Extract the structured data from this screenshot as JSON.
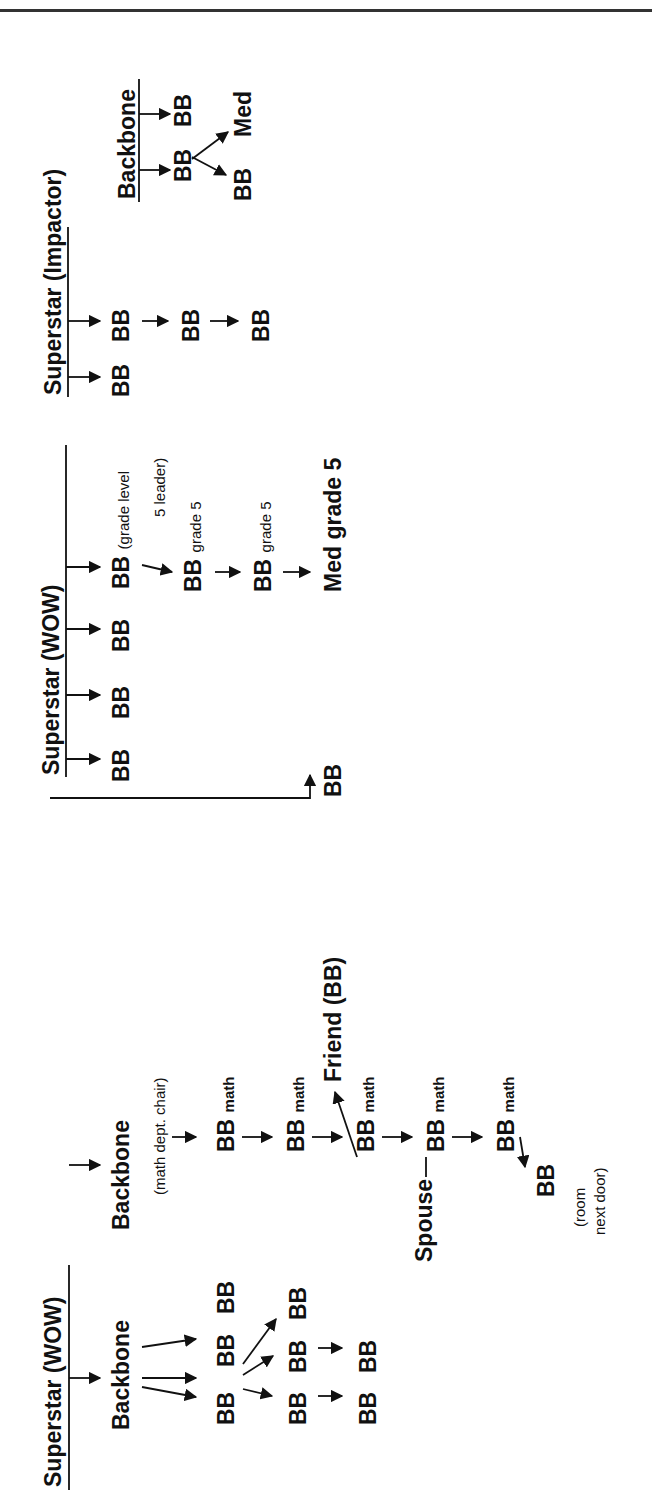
{
  "diagram": {
    "type": "mentoring-network-tree",
    "orientation": "rotated -90deg (text reads bottom-to-top)",
    "groups": [
      {
        "id": "superstar-wow-1",
        "title": "Superstar (WOW)",
        "children": [
          {
            "label": "Backbone",
            "children": [
              {
                "label": "BB",
                "children": [
                  {
                    "label": "BB",
                    "children": [
                      {
                        "label": "BB"
                      }
                    ]
                  },
                  {
                    "label": "BB",
                    "children": [
                      {
                        "label": "BB"
                      }
                    ]
                  },
                  {
                    "label": "BB"
                  }
                ]
              },
              {
                "label": "BB"
              },
              {
                "label": "BB"
              }
            ]
          },
          {
            "label": "Backbone",
            "note": "(math dept. chair)",
            "chain": [
              {
                "label": "BB",
                "suffix": "math"
              },
              {
                "label": "BB",
                "suffix": "math"
              },
              {
                "label": "BB",
                "suffix": "math",
                "branch": "Friend (BB)"
              },
              {
                "label": "BB",
                "suffix": "math",
                "linked": "Spouse"
              },
              {
                "label": "BB",
                "suffix": "math",
                "branch": "BB (room next door)"
              }
            ]
          }
        ]
      },
      {
        "id": "superstar-wow-2",
        "title": "Superstar (WOW)",
        "children": [
          "BB",
          "BB",
          "BB",
          "BB (grade level 5 leader)"
        ],
        "chain": [
          "BB grade 5",
          "BB grade 5",
          "Med grade 5"
        ],
        "cross_link": "Superstar (WOW) -> BB (reached via Friend (BB))"
      },
      {
        "id": "superstar-impactor",
        "title": "Superstar (Impactor)",
        "children": [
          "BB",
          "BB"
        ],
        "chain": [
          "BB",
          "BB"
        ]
      },
      {
        "id": "backbone-3",
        "title": "Backbone",
        "children": [
          "BB",
          "BB"
        ],
        "branches": [
          "BB",
          "Med"
        ]
      }
    ]
  },
  "labels": {
    "ss_wow_1": "Superstar (WOW)",
    "backbone_a": "Backbone",
    "backbone_b": "Backbone",
    "backbone_b_note": "(math dept. chair)",
    "bb": "BB",
    "math": "math",
    "friend": "Friend (BB)",
    "spouse": "Spouse",
    "room_note_1": "(room",
    "room_note_2": "next door)",
    "ss_wow_2": "Superstar (WOW)",
    "grade_leader_1": "(grade level",
    "grade_leader_2": "5 leader)",
    "grade5": "grade 5",
    "med": "Med",
    "med_grade5": "Med grade 5",
    "ss_impactor": "Superstar (Impactor)",
    "backbone_c": "Backbone"
  },
  "colors": {
    "ink": "#111111",
    "rule": "#333333",
    "background": "#ffffff"
  }
}
